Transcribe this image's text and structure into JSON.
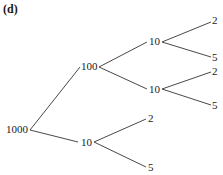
{
  "title": "(d)",
  "tree": {
    "root": {
      "label": "1000"
    },
    "level1": [
      {
        "label": "100"
      },
      {
        "label": "10"
      }
    ],
    "level2": [
      {
        "label": "10"
      },
      {
        "label": "10"
      },
      {
        "label": "2"
      },
      {
        "label": "5"
      }
    ],
    "level3": [
      {
        "label": "2"
      },
      {
        "label": "5"
      },
      {
        "label": "2"
      },
      {
        "label": "5"
      }
    ]
  },
  "colors": {
    "line": "#333333",
    "text": "#1a1a1a",
    "background": "#ffffff"
  }
}
